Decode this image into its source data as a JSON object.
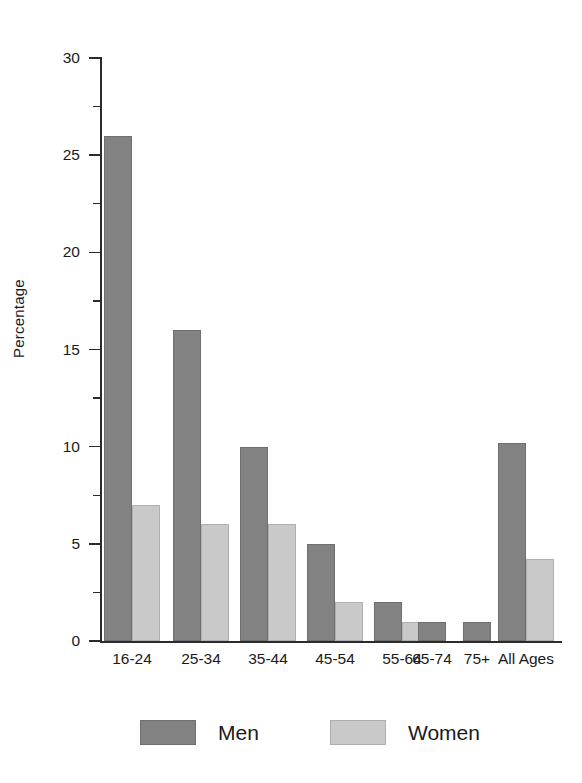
{
  "chart_data": {
    "type": "bar",
    "title": "",
    "subtitle": "",
    "xlabel": "",
    "ylabel": "Percentage",
    "ylim": [
      0,
      30
    ],
    "y_ticks": [
      0,
      5,
      10,
      15,
      20,
      25,
      30
    ],
    "y_tick_labels": [
      "0",
      "5",
      "10",
      "15",
      "20",
      "25",
      "30"
    ],
    "y_minor_ticks": [
      2.5,
      7.5,
      12.5,
      17.5,
      22.5,
      27.5
    ],
    "grid": false,
    "legend_position": "bottom",
    "categories": [
      "16-24",
      "25-34",
      "35-44",
      "45-54",
      "55-64",
      "65-74",
      "75+",
      "All Ages"
    ],
    "series": [
      {
        "name": "Men",
        "color": "#828282",
        "values": [
          26,
          16,
          10,
          5,
          2,
          1,
          1,
          10.2
        ]
      },
      {
        "name": "Women",
        "color": "#c9c9c9",
        "values": [
          7,
          6,
          6,
          2,
          1,
          0,
          0,
          4.2
        ]
      }
    ]
  },
  "legend": {
    "entries": [
      {
        "label": "Men",
        "color": "#828282"
      },
      {
        "label": "Women",
        "color": "#c9c9c9"
      }
    ]
  }
}
